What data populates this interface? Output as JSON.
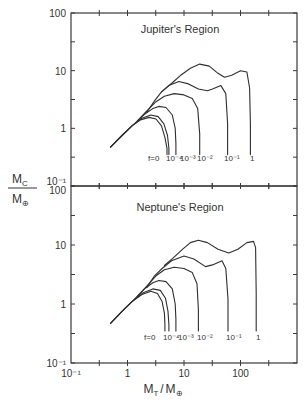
{
  "chart_data": [
    {
      "type": "line",
      "title": "Jupiter's Region",
      "xlabel": "M_T / M_⊕",
      "ylabel": "M_C / M_⊕",
      "xscale": "log",
      "yscale": "log",
      "xlim": [
        0.1,
        1000
      ],
      "ylim": [
        0.1,
        100
      ],
      "x_ticklabels": [
        "10^-1",
        "1",
        "10",
        "100"
      ],
      "y_ticklabels": [
        "10^-1",
        "1",
        "10",
        "100"
      ],
      "grid": false,
      "legend": "inline labels at curve bases",
      "series": [
        {
          "name": "f=0",
          "label": "f=0",
          "x": [
            0.5,
            0.8,
            1.2,
            1.7,
            2.4,
            3.2,
            4.0,
            4.6,
            5.0,
            5.0
          ],
          "y": [
            0.47,
            0.75,
            1.1,
            1.4,
            1.55,
            1.45,
            1.1,
            0.7,
            0.45,
            0.35
          ]
        },
        {
          "name": "f=1e-4",
          "label": "10^-4",
          "x": [
            0.5,
            0.8,
            1.2,
            1.8,
            2.6,
            3.5,
            4.4,
            5.1,
            5.4,
            5.4
          ],
          "y": [
            0.47,
            0.75,
            1.1,
            1.5,
            1.7,
            1.6,
            1.2,
            0.75,
            0.45,
            0.35
          ]
        },
        {
          "name": "f=1e-3",
          "label": "10^-3",
          "x": [
            0.5,
            0.8,
            1.2,
            2.0,
            2.8,
            3.6,
            4.8,
            6.2,
            7.0,
            7.2,
            7.2
          ],
          "y": [
            0.47,
            0.75,
            1.1,
            1.75,
            2.2,
            2.4,
            2.3,
            1.7,
            1.0,
            0.55,
            0.35
          ]
        },
        {
          "name": "f=1e-2",
          "label": "10^-2",
          "x": [
            1.5,
            2.2,
            3.2,
            4.5,
            6.7,
            10,
            14,
            17.5,
            19,
            19
          ],
          "y": [
            1.35,
            2.0,
            2.9,
            3.6,
            4.0,
            3.8,
            3.3,
            2.2,
            0.8,
            0.35
          ]
        },
        {
          "name": "f=1e-1",
          "label": "10^-1",
          "x": [
            2.2,
            3.0,
            4.0,
            5.5,
            8.1,
            12,
            18,
            26,
            32,
            45,
            55,
            59,
            59
          ],
          "y": [
            1.9,
            3.0,
            4.3,
            5.6,
            6.5,
            5.9,
            4.8,
            4.5,
            4.8,
            5.5,
            4.0,
            1.2,
            0.35
          ]
        },
        {
          "name": "f=1",
          "label": "1",
          "x": [
            4.0,
            6.0,
            9.0,
            13,
            19,
            28,
            40,
            52,
            70,
            100,
            130,
            145,
            150,
            150
          ],
          "y": [
            4.3,
            6.0,
            8.5,
            11,
            13,
            12,
            9.0,
            7.7,
            8.3,
            10,
            9.5,
            5.0,
            1.2,
            0.35
          ]
        }
      ]
    },
    {
      "type": "line",
      "title": "Neptune's Region",
      "xlabel": "M_T / M_⊕",
      "ylabel": "M_C / M_⊕",
      "xscale": "log",
      "yscale": "log",
      "xlim": [
        0.1,
        1000
      ],
      "ylim": [
        0.1,
        100
      ],
      "x_ticklabels": [
        "10^-1",
        "1",
        "10",
        "100"
      ],
      "y_ticklabels": [
        "10^-1",
        "1",
        "10",
        "100"
      ],
      "grid": false,
      "legend": "inline labels at curve bases",
      "series": [
        {
          "name": "f=0",
          "label": "f=0",
          "x": [
            0.5,
            0.8,
            1.2,
            1.8,
            2.6,
            3.4,
            4.1,
            4.5,
            4.6,
            4.6
          ],
          "y": [
            0.47,
            0.75,
            1.1,
            1.45,
            1.65,
            1.5,
            1.1,
            0.7,
            0.45,
            0.35
          ]
        },
        {
          "name": "f=1e-4",
          "label": "10^-4",
          "x": [
            0.5,
            0.8,
            1.2,
            1.9,
            2.8,
            3.8,
            4.7,
            5.2,
            5.4,
            5.4
          ],
          "y": [
            0.47,
            0.75,
            1.1,
            1.55,
            1.8,
            1.7,
            1.25,
            0.75,
            0.45,
            0.35
          ]
        },
        {
          "name": "f=1e-3",
          "label": "10^-3",
          "x": [
            0.5,
            0.8,
            1.2,
            2.0,
            2.8,
            3.6,
            4.8,
            6.2,
            7.0,
            7.2,
            7.2
          ],
          "y": [
            0.47,
            0.75,
            1.1,
            1.8,
            2.3,
            2.5,
            2.4,
            1.8,
            1.0,
            0.55,
            0.35
          ]
        },
        {
          "name": "f=1e-2",
          "label": "10^-2",
          "x": [
            1.5,
            2.2,
            3.2,
            4.5,
            6.7,
            10,
            14,
            17,
            18,
            18
          ],
          "y": [
            1.35,
            2.0,
            3.0,
            3.8,
            4.2,
            4.0,
            3.4,
            2.2,
            0.8,
            0.35
          ]
        },
        {
          "name": "f=1e-1",
          "label": "10^-1",
          "x": [
            2.2,
            3.0,
            4.1,
            6.0,
            10,
            15,
            24,
            32,
            47,
            55,
            60,
            60
          ],
          "y": [
            1.9,
            3.0,
            4.0,
            5.4,
            6.5,
            5.8,
            4.3,
            4.6,
            5.4,
            4.0,
            1.2,
            0.35
          ]
        },
        {
          "name": "f=1",
          "label": "1",
          "x": [
            4.5,
            6.4,
            9.5,
            13,
            18,
            26,
            40,
            62,
            90,
            130,
            170,
            185,
            190,
            190
          ],
          "y": [
            4.5,
            6.0,
            8.5,
            11,
            12,
            11,
            8.5,
            7.3,
            8.5,
            11,
            11.5,
            9.0,
            1.5,
            0.35
          ]
        }
      ]
    }
  ],
  "panels": [
    {
      "title": "Jupiter's Region"
    },
    {
      "title": "Neptune's Region"
    }
  ],
  "axes": {
    "ylabel_num": "M",
    "ylabel_num_sub": "C",
    "ylabel_den": "M",
    "ylabel_den_sub": "⊕",
    "xlabel_num": "M",
    "xlabel_num_sub": "T",
    "xlabel_slash": "/",
    "xlabel_den": "M",
    "xlabel_den_sub": "⊕",
    "x_ticks": [
      {
        "value": 0.1,
        "label": "10⁻¹"
      },
      {
        "value": 1,
        "label": "1"
      },
      {
        "value": 10,
        "label": "10"
      },
      {
        "value": 100,
        "label": "100"
      }
    ],
    "y_ticks_top": [
      {
        "value": 100,
        "label": "100"
      },
      {
        "value": 10,
        "label": "10"
      },
      {
        "value": 1,
        "label": "1"
      },
      {
        "value": 0.1,
        "label": "10⁻¹"
      }
    ],
    "y_ticks_bottom": [
      {
        "value": 100,
        "label": "100"
      },
      {
        "value": 10,
        "label": "10"
      },
      {
        "value": 1,
        "label": "1"
      },
      {
        "value": 0.1,
        "label": "10⁻¹"
      }
    ]
  },
  "curve_labels": {
    "f0": "f=0",
    "f1e4": "10⁻⁴",
    "f1e3": "10⁻³",
    "f1e2": "10⁻²",
    "f1e1": "10⁻¹",
    "f1": "1"
  }
}
